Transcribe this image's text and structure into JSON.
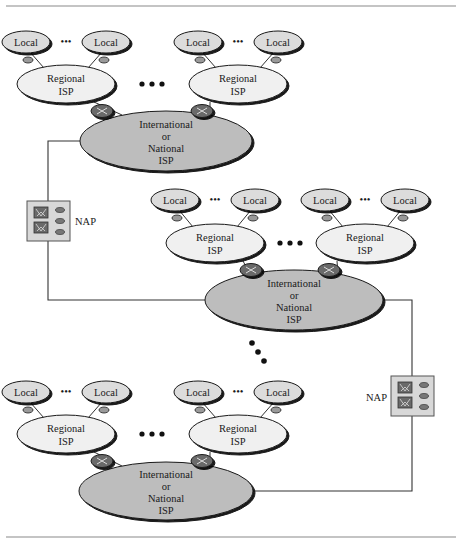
{
  "figure": {
    "top_rule": true,
    "bottom_rule": true
  },
  "labels": {
    "local": "Local",
    "regional_line1": "Regional",
    "regional_line2": "ISP",
    "intl_line1": "International",
    "intl_line2": "or",
    "intl_line3": "National",
    "intl_line4": "ISP",
    "nap": "NAP",
    "ellipsis_small": "•••",
    "ellipsis_large": "• • •"
  },
  "colors": {
    "local_fill": "#dcdcdc",
    "regional_fill": "#f0f0f0",
    "intl_fill": "#bdbdbd",
    "router_fill": "#6a6a6a",
    "connector_fill": "#9a9a9a",
    "nap_fill": "#d8d8d8",
    "outline": "#1a1a1a"
  },
  "groups": [
    {
      "name": "top",
      "regionals": [
        {
          "locals": [
            "Local",
            "Local"
          ]
        },
        {
          "locals": [
            "Local",
            "Local"
          ]
        }
      ],
      "backbone": "International or National ISP"
    },
    {
      "name": "middle",
      "regionals": [
        {
          "locals": [
            "Local",
            "Local"
          ]
        },
        {
          "locals": [
            "Local",
            "Local"
          ]
        }
      ],
      "backbone": "International or National ISP"
    },
    {
      "name": "bottom",
      "regionals": [
        {
          "locals": [
            "Local",
            "Local"
          ]
        },
        {
          "locals": [
            "Local",
            "Local"
          ]
        }
      ],
      "backbone": "International or National ISP"
    }
  ],
  "naps": [
    {
      "label": "NAP",
      "links": [
        "top",
        "middle"
      ]
    },
    {
      "label": "NAP",
      "links": [
        "middle",
        "bottom"
      ]
    }
  ]
}
